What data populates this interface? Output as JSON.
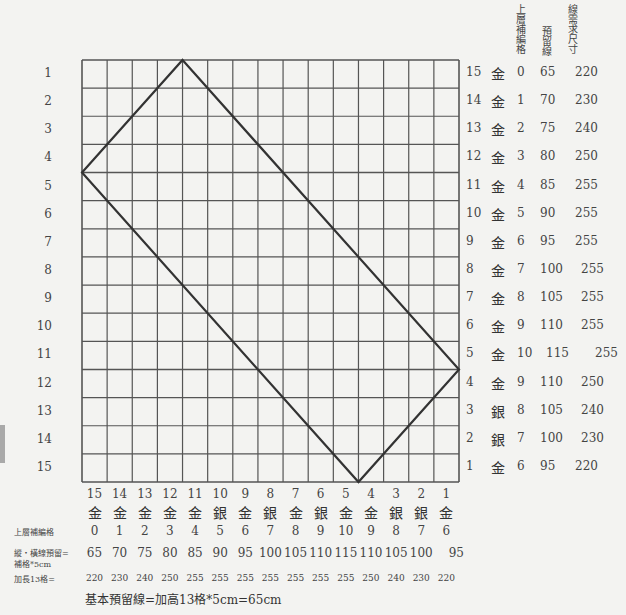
{
  "diagram": {
    "grid": {
      "rows": 15,
      "cols": 15,
      "left": 82,
      "top": 60,
      "width": 377,
      "height": 422
    },
    "diamond_points": {
      "top": [
        4,
        0
      ],
      "left": [
        0,
        4
      ],
      "bottom": [
        11,
        15
      ],
      "right": [
        15,
        11
      ]
    },
    "line_color": "#333333",
    "grid_color": "#555555"
  },
  "left_row_numbers": [
    "1",
    "2",
    "3",
    "4",
    "5",
    "6",
    "7",
    "8",
    "9",
    "10",
    "11",
    "12",
    "13",
    "14",
    "15"
  ],
  "right_table": {
    "headers": {
      "upper_layer": "上層補編格",
      "reserve": "預留線",
      "required": "線需求尺寸"
    },
    "rows": [
      {
        "num": "15",
        "type": "金",
        "upper": "0",
        "reserve": "65",
        "required": "220"
      },
      {
        "num": "14",
        "type": "金",
        "upper": "1",
        "reserve": "70",
        "required": "230"
      },
      {
        "num": "13",
        "type": "金",
        "upper": "2",
        "reserve": "75",
        "required": "240"
      },
      {
        "num": "12",
        "type": "金",
        "upper": "3",
        "reserve": "80",
        "required": "250"
      },
      {
        "num": "11",
        "type": "金",
        "upper": "4",
        "reserve": "85",
        "required": "255"
      },
      {
        "num": "10",
        "type": "金",
        "upper": "5",
        "reserve": "90",
        "required": "255"
      },
      {
        "num": "9",
        "type": "金",
        "upper": "6",
        "reserve": "95",
        "required": "255"
      },
      {
        "num": "8",
        "type": "金",
        "upper": "7",
        "reserve": "100",
        "required": "255"
      },
      {
        "num": "7",
        "type": "金",
        "upper": "8",
        "reserve": "105",
        "required": "255"
      },
      {
        "num": "6",
        "type": "金",
        "upper": "9",
        "reserve": "110",
        "required": "255"
      },
      {
        "num": "5",
        "type": "金",
        "upper": "10",
        "reserve": "115",
        "required": "255"
      },
      {
        "num": "4",
        "type": "金",
        "upper": "9",
        "reserve": "110",
        "required": "250"
      },
      {
        "num": "3",
        "type": "銀",
        "upper": "8",
        "reserve": "105",
        "required": "240"
      },
      {
        "num": "2",
        "type": "銀",
        "upper": "7",
        "reserve": "100",
        "required": "230"
      },
      {
        "num": "1",
        "type": "金",
        "upper": "6",
        "reserve": "95",
        "required": "220"
      }
    ]
  },
  "bottom_table": {
    "labels": {
      "upper_layer": "上層補編格",
      "reserve_line1": "縱・橫線預留=",
      "reserve_line2": "補格*5cm",
      "extend": "加長13格="
    },
    "cols": [
      {
        "num": "15",
        "type": "金",
        "upper": "0",
        "reserve": "65",
        "extend": "220"
      },
      {
        "num": "14",
        "type": "金",
        "upper": "1",
        "reserve": "70",
        "extend": "230"
      },
      {
        "num": "13",
        "type": "金",
        "upper": "2",
        "reserve": "75",
        "extend": "240"
      },
      {
        "num": "12",
        "type": "金",
        "upper": "3",
        "reserve": "80",
        "extend": "250"
      },
      {
        "num": "11",
        "type": "金",
        "upper": "4",
        "reserve": "85",
        "extend": "255"
      },
      {
        "num": "10",
        "type": "銀",
        "upper": "5",
        "reserve": "90",
        "extend": "255"
      },
      {
        "num": "9",
        "type": "金",
        "upper": "6",
        "reserve": "95",
        "extend": "255"
      },
      {
        "num": "8",
        "type": "銀",
        "upper": "7",
        "reserve": "100",
        "extend": "255"
      },
      {
        "num": "7",
        "type": "金",
        "upper": "8",
        "reserve": "105",
        "extend": "255"
      },
      {
        "num": "6",
        "type": "銀",
        "upper": "9",
        "reserve": "110",
        "extend": "255"
      },
      {
        "num": "5",
        "type": "金",
        "upper": "10",
        "reserve": "115",
        "extend": "255"
      },
      {
        "num": "4",
        "type": "金",
        "upper": "9",
        "reserve": "110",
        "extend": "250"
      },
      {
        "num": "3",
        "type": "銀",
        "upper": "8",
        "reserve": "105",
        "extend": "240"
      },
      {
        "num": "2",
        "type": "銀",
        "upper": "7",
        "reserve": "100",
        "extend": "230"
      },
      {
        "num": "1",
        "type": "金",
        "upper": "6",
        "reserve": "95",
        "extend": "220"
      }
    ]
  },
  "footer_note": "基本預留線=加高13格*5cm=65cm"
}
